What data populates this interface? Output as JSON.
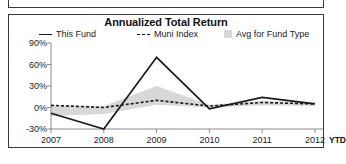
{
  "chart_data": {
    "type": "line",
    "title": "Annualized Total Return",
    "xlabel": "",
    "ylabel": "",
    "x": [
      "2007",
      "2008",
      "2009",
      "2010",
      "2011",
      "2012"
    ],
    "categories": [
      "2007",
      "2008",
      "2009",
      "2010",
      "2011",
      "2012"
    ],
    "ytick_labels": [
      "90%",
      "60%",
      "30%",
      "0%",
      "-30%"
    ],
    "ytick_values": [
      90,
      60,
      30,
      0,
      -30
    ],
    "ylim": [
      -30,
      90
    ],
    "grid": false,
    "legend_position": "top",
    "x_axis_note": "YTD",
    "series": [
      {
        "name": "This Fund",
        "style": "solid",
        "color": "#1a1a1a",
        "values": [
          -8,
          -30,
          70,
          -2,
          14,
          5
        ]
      },
      {
        "name": "Muni Index",
        "style": "dashed",
        "color": "#1a1a1a",
        "values": [
          3,
          0,
          10,
          2,
          7,
          5
        ]
      },
      {
        "name": "Avg for Fund Type",
        "style": "band",
        "color": "#d8d8d8",
        "upper": [
          3,
          2,
          30,
          4,
          9,
          7
        ],
        "lower": [
          -12,
          -9,
          4,
          0,
          3,
          2
        ]
      }
    ]
  },
  "legend": {
    "this_fund": "This Fund",
    "muni_index": "Muni Index",
    "avg_for_fund_type": "Avg for Fund Type"
  },
  "colors": {
    "line": "#1a1a1a",
    "band": "#d8d8d8",
    "axis": "#8a8a8a",
    "border": "#3a3a3a"
  }
}
